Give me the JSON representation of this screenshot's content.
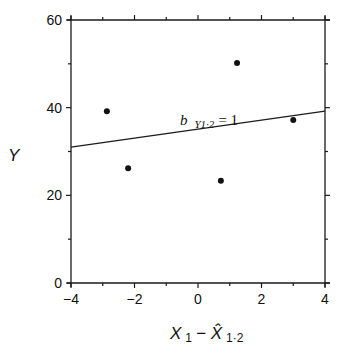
{
  "chart_data": {
    "type": "scatter",
    "title": "",
    "xlabel": "X1 − X̂1·2",
    "xlabel_parts": {
      "main": "X",
      "sub1": "1",
      "minus": " − ",
      "hat": "X̂",
      "sub2": "1·2"
    },
    "ylabel": "Y",
    "xlim": [
      -4,
      4
    ],
    "ylim": [
      0,
      60
    ],
    "x_ticks": [
      -4,
      -2,
      0,
      2,
      4
    ],
    "x_tick_labels": [
      "−4",
      "−2",
      "0",
      "2",
      "4"
    ],
    "y_ticks": [
      0,
      20,
      40,
      60
    ],
    "y_tick_labels": [
      "0",
      "20",
      "40",
      "60"
    ],
    "x_minor_step": 1,
    "y_minor_step": 10,
    "grid": false,
    "legend": null,
    "series": [
      {
        "name": "points",
        "type": "scatter",
        "x": [
          -2.87,
          -2.2,
          1.23,
          0.72,
          3.0
        ],
        "y": [
          39.2,
          26.2,
          50.2,
          23.3,
          37.2
        ]
      },
      {
        "name": "regression line",
        "type": "line",
        "x": [
          -4,
          4
        ],
        "y": [
          31.0,
          39.2
        ]
      }
    ],
    "annotations": [
      {
        "text": "b Y1·2 = 1",
        "main": "b",
        "sub": "Y1·2",
        "rest": " = 1",
        "x": 0.0,
        "y": 37.3
      }
    ]
  }
}
